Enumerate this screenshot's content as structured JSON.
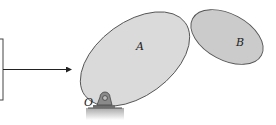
{
  "diagram": {
    "bodies": [
      {
        "id": "A",
        "label": "A",
        "fill": "#d9d9d9",
        "stroke": "#555555"
      },
      {
        "id": "B",
        "label": "B",
        "fill": "#c8c8c8",
        "stroke": "#555555"
      }
    ],
    "pivot": {
      "label": "O"
    },
    "arrow": {
      "direction": "right"
    },
    "colors": {
      "support": "#8a8a8a",
      "ground": "#b0b0b0",
      "line": "#222222"
    }
  }
}
